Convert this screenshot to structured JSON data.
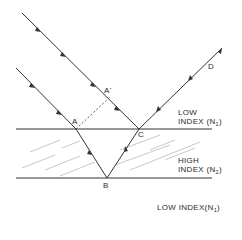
{
  "diagram": {
    "points": {
      "A": "A",
      "A_prime": "A'",
      "B": "B",
      "C": "C",
      "D": "D"
    },
    "regions": {
      "top": {
        "line1": "LOW",
        "line2_prefix": "INDEX (N",
        "line2_sub": "1",
        "line2_suffix": ")"
      },
      "middle": {
        "line1": "HIGH",
        "line2_prefix": "INDEX (N",
        "line2_sub": "2",
        "line2_suffix": ")"
      },
      "bottom": {
        "prefix": "LOW INDEX(N",
        "sub": "1",
        "suffix": ")"
      }
    },
    "colors": {
      "line": "#333333",
      "hatch": "#9a9a9a",
      "background": "#ffffff"
    }
  }
}
